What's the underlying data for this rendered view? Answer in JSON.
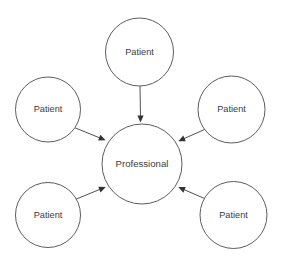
{
  "diagram": {
    "type": "hub-and-spoke",
    "background_color": "#ffffff",
    "node_fill_color": "#ffffff",
    "node_stroke_color": "#5d5d5d",
    "edge_color": "#4f4f4f",
    "arrowhead_color": "#333333",
    "label_color": "#3b3b3b",
    "center": {
      "id": "professional",
      "label": "Professional",
      "cx": 142,
      "cy": 164,
      "r": 40
    },
    "nodes": [
      {
        "id": "patient-top",
        "label": "Patient",
        "cx": 139.5,
        "cy": 52,
        "r": 34
      },
      {
        "id": "patient-upper-left",
        "label": "Patient",
        "cx": 48,
        "cy": 109.5,
        "r": 32.5
      },
      {
        "id": "patient-upper-right",
        "label": "Patient",
        "cx": 231.5,
        "cy": 109.5,
        "r": 33.5
      },
      {
        "id": "patient-lower-left",
        "label": "Patient",
        "cx": 48,
        "cy": 215,
        "r": 32.5
      },
      {
        "id": "patient-lower-right",
        "label": "Patient",
        "cx": 233.5,
        "cy": 215,
        "r": 33.5
      }
    ],
    "edges": [
      {
        "id": "edge-top",
        "from": "patient-top",
        "to": "professional",
        "x1": 140,
        "y1": 86,
        "x2": 140.5,
        "y2": 121,
        "direction": "to-center"
      },
      {
        "id": "edge-upper-left",
        "from": "patient-upper-left",
        "to": "professional",
        "x1": 73,
        "y1": 127,
        "x2": 105,
        "y2": 140,
        "direction": "to-center"
      },
      {
        "id": "edge-upper-right",
        "from": "patient-upper-right",
        "to": "professional",
        "x1": 210,
        "y1": 127,
        "x2": 179,
        "y2": 141,
        "direction": "to-center"
      },
      {
        "id": "edge-lower-left",
        "from": "patient-lower-left",
        "to": "professional",
        "x1": 74,
        "y1": 200,
        "x2": 105,
        "y2": 187,
        "direction": "to-center"
      },
      {
        "id": "edge-lower-right",
        "from": "patient-lower-right",
        "to": "professional",
        "x1": 208,
        "y1": 200,
        "x2": 179,
        "y2": 187,
        "direction": "to-center"
      }
    ]
  }
}
